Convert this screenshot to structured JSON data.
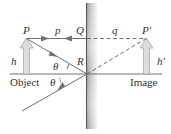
{
  "diagram": {
    "labels": {
      "object_point": "P",
      "image_point": "P'",
      "object_distance": "p",
      "image_distance": "q",
      "mirror_top_point": "Q",
      "mirror_incidence_point": "R",
      "object_height": "h",
      "image_height": "h'",
      "angle_incident": "θ",
      "angle_reflected": "θ",
      "object_caption": "Object",
      "image_caption": "Image"
    },
    "colors": {
      "line": "#707070",
      "arrow_fill": "#d9d9d9",
      "mirror_dark": "#6a6a6a",
      "mirror_light": "#e8e8e8",
      "text": "#333333"
    }
  }
}
